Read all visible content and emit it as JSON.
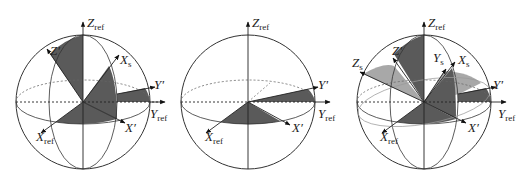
{
  "figure": {
    "panels": [
      {
        "id": "a",
        "labels": {
          "z_ref": "Z",
          "z_ref_sub": "ref",
          "y_ref": "Y",
          "y_ref_sub": "ref",
          "x_ref": "X",
          "x_ref_sub": "ref",
          "z_prime": "Z′",
          "y_prime": "Y′",
          "x_prime": "X′",
          "x_s": "X",
          "x_s_sub": "s"
        }
      },
      {
        "id": "b",
        "labels": {
          "z_ref": "Z",
          "z_ref_sub": "ref",
          "y_ref": "Y",
          "y_ref_sub": "ref",
          "x_ref": "X",
          "x_ref_sub": "ref",
          "y_prime": "Y′",
          "x_prime": "X′"
        }
      },
      {
        "id": "c",
        "labels": {
          "z_ref": "Z",
          "z_ref_sub": "ref",
          "y_ref": "Y",
          "y_ref_sub": "ref",
          "x_ref": "X",
          "x_ref_sub": "ref",
          "z_prime": "Z′",
          "y_prime": "Y′",
          "x_prime": "X′",
          "x_s": "X",
          "x_s_sub": "s",
          "y_s": "Y",
          "y_s_sub": "s",
          "z_s": "Z",
          "z_s_sub": "s"
        }
      }
    ],
    "colors": {
      "dark_fill": "#5a5a5a",
      "light_fill": "#a8a8a8",
      "line": "#333333",
      "dotted": "#555555"
    }
  }
}
